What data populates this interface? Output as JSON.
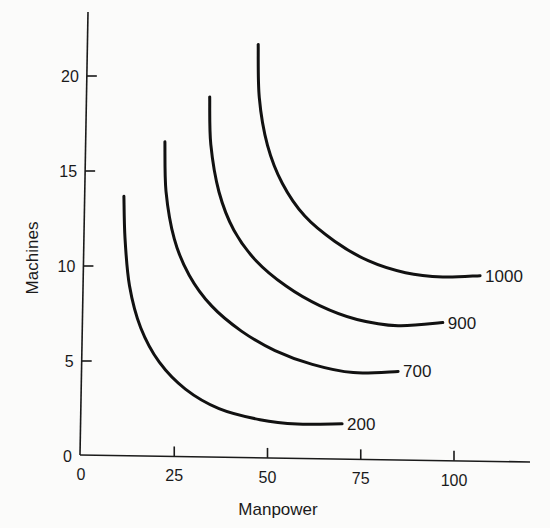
{
  "chart_data": {
    "type": "line",
    "title": "",
    "xlabel": "Manpower",
    "ylabel": "Machines",
    "xlim": [
      0,
      120
    ],
    "ylim": [
      0,
      23
    ],
    "grid": false,
    "legend": "none (curves labeled directly at right end)",
    "x_ticks": [
      0,
      25,
      50,
      75,
      100
    ],
    "y_ticks": [
      0,
      5,
      10,
      15,
      20
    ],
    "series": [
      {
        "name": "200",
        "points": [
          [
            11.5,
            13.7
          ],
          [
            11.8,
            11.5
          ],
          [
            13,
            9
          ],
          [
            16,
            6.8
          ],
          [
            21,
            5
          ],
          [
            28,
            3.6
          ],
          [
            37,
            2.6
          ],
          [
            48,
            2.05
          ],
          [
            58,
            1.85
          ],
          [
            70,
            1.9
          ]
        ]
      },
      {
        "name": "700",
        "points": [
          [
            22.5,
            16.6
          ],
          [
            22.8,
            14
          ],
          [
            25,
            11.5
          ],
          [
            29,
            9.6
          ],
          [
            35,
            8
          ],
          [
            43,
            6.7
          ],
          [
            52,
            5.7
          ],
          [
            62,
            5.0
          ],
          [
            73,
            4.6
          ],
          [
            85,
            4.7
          ]
        ]
      },
      {
        "name": "900",
        "points": [
          [
            34.5,
            19.0
          ],
          [
            34.8,
            16.5
          ],
          [
            37,
            14
          ],
          [
            41,
            12
          ],
          [
            47,
            10.4
          ],
          [
            55,
            9.1
          ],
          [
            64,
            8.1
          ],
          [
            74,
            7.4
          ],
          [
            85,
            7.1
          ],
          [
            97,
            7.3
          ]
        ]
      },
      {
        "name": "1000",
        "points": [
          [
            47.5,
            21.8
          ],
          [
            47.8,
            19
          ],
          [
            50,
            16.5
          ],
          [
            54,
            14.5
          ],
          [
            60,
            12.8
          ],
          [
            68,
            11.5
          ],
          [
            77,
            10.5
          ],
          [
            87,
            9.9
          ],
          [
            97,
            9.7
          ],
          [
            107,
            9.8
          ]
        ]
      }
    ],
    "annotations": [
      "200",
      "700",
      "900",
      "1000"
    ]
  },
  "labels": {
    "x_axis_title": "Manpower",
    "y_axis_title": "Machines",
    "x_ticks": [
      "0",
      "25",
      "50",
      "75",
      "100"
    ],
    "y_ticks": [
      "0",
      "5",
      "10",
      "15",
      "20"
    ],
    "curves": [
      "200",
      "700",
      "900",
      "1000"
    ]
  }
}
